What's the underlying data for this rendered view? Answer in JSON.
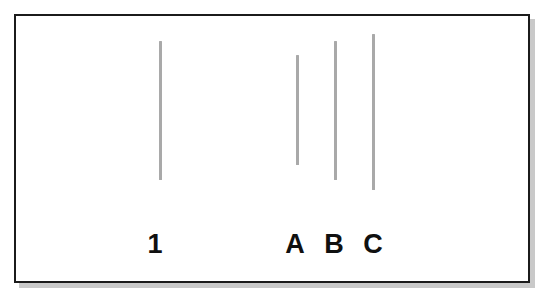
{
  "figure": {
    "background_color": "#ffffff",
    "frame": {
      "name": "outer-frame",
      "border_color": "#1b1b1b",
      "border_width_px": 2,
      "shadow_color": "#c9c9c9",
      "x": 14,
      "y": 14,
      "width": 516,
      "height": 269
    },
    "line_color": "#a9a9a9",
    "label_color": "#101010"
  },
  "chart_data": {
    "type": "bar",
    "xlabel": "",
    "ylabel": "",
    "orientation": "vertical-lines",
    "grid": false,
    "legend": false,
    "categories": [
      "1",
      "A",
      "B",
      "C"
    ],
    "values": [
      139,
      110,
      139,
      156
    ],
    "units": "px",
    "lines": [
      {
        "label": "1",
        "x": 159,
        "y_top": 41,
        "y_bottom": 180,
        "length": 139,
        "thickness": 3,
        "color": "#a9a9a9"
      },
      {
        "label": "A",
        "x": 296,
        "y_top": 55,
        "y_bottom": 165,
        "length": 110,
        "thickness": 3,
        "color": "#a9a9a9"
      },
      {
        "label": "B",
        "x": 334,
        "y_top": 41,
        "y_bottom": 180,
        "length": 139,
        "thickness": 3,
        "color": "#a9a9a9"
      },
      {
        "label": "C",
        "x": 372,
        "y_top": 34,
        "y_bottom": 190,
        "length": 156,
        "thickness": 3,
        "color": "#a9a9a9"
      }
    ]
  },
  "labels": [
    {
      "text": "1",
      "x": 154,
      "y": 231
    },
    {
      "text": "A",
      "x": 294,
      "y": 231
    },
    {
      "text": "B",
      "x": 334,
      "y": 231
    },
    {
      "text": "C",
      "x": 373,
      "y": 231
    }
  ]
}
